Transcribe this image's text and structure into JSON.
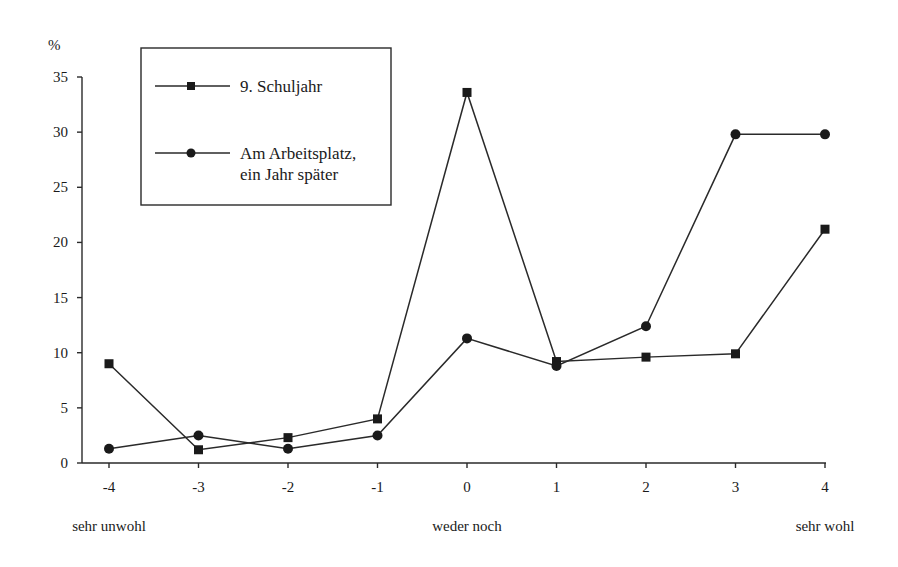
{
  "chart_data": {
    "type": "line",
    "title": "",
    "ylabel": "%",
    "xlabel": "",
    "x": [
      -4,
      -3,
      -2,
      -1,
      0,
      1,
      2,
      3,
      4
    ],
    "x_tick_labels": [
      "-4",
      "-3",
      "-2",
      "-1",
      "0",
      "1",
      "2",
      "3",
      "4"
    ],
    "x_anchor_labels": [
      {
        "x": -4,
        "text": "sehr unwohl"
      },
      {
        "x": 0,
        "text": "weder noch"
      },
      {
        "x": 4,
        "text": "sehr wohl"
      }
    ],
    "y_ticks": [
      0,
      5,
      10,
      15,
      20,
      25,
      30,
      35
    ],
    "y_tick_labels": [
      "0",
      "5",
      "10",
      "15",
      "20",
      "25",
      "30",
      "35"
    ],
    "ylim": [
      0,
      35
    ],
    "grid": false,
    "legend_position": "top-left",
    "series": [
      {
        "name": "9. Schuljahr",
        "legend_lines": [
          "9. Schuljahr"
        ],
        "marker": "square",
        "values": [
          9.0,
          1.2,
          2.3,
          4.0,
          33.6,
          9.2,
          9.6,
          9.9,
          21.2
        ]
      },
      {
        "name": "Am Arbeitsplatz, ein Jahr später",
        "legend_lines": [
          "Am Arbeitsplatz,",
          "ein Jahr später"
        ],
        "marker": "circle",
        "values": [
          1.3,
          2.5,
          1.3,
          2.5,
          11.3,
          8.8,
          12.4,
          29.8,
          29.8
        ]
      }
    ]
  }
}
